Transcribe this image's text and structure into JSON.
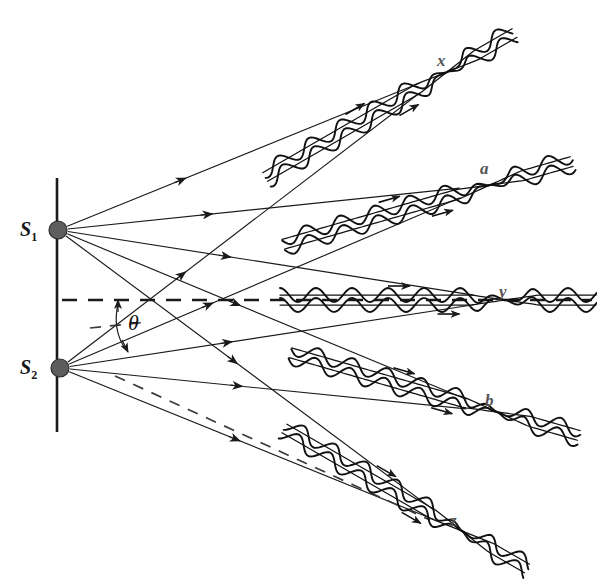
{
  "figure": {
    "background_color": "#ffffff",
    "ink_color": "#1a1a1a",
    "label_color": "#555555",
    "source_dot_color": "#5d5d5d"
  },
  "sources": [
    {
      "id": "s1",
      "label": "S",
      "subscript": "1",
      "x": 58,
      "y": 230,
      "radius": 9
    },
    {
      "id": "s2",
      "label": "S",
      "subscript": "2",
      "x": 60,
      "y": 368,
      "radius": 9
    }
  ],
  "angle": {
    "symbol": "θ",
    "x": 128,
    "y": 310,
    "description": "angle between central axis and ray direction"
  },
  "barrier": {
    "x": 57,
    "y_top": 178,
    "y_bottom": 432,
    "description": "vertical line through both sources"
  },
  "center_axis": {
    "y": 300,
    "x_start": 62,
    "x_end": 592,
    "style": "dashed",
    "description": "horizontal central axis"
  },
  "aux_line": {
    "style": "dashed",
    "description": "dashed construction ray from S2 downward-right"
  },
  "convergence_points": [
    {
      "label": "x",
      "x": 437,
      "y": 52
    },
    {
      "label": "a",
      "x": 480,
      "y": 160
    },
    {
      "label": "y",
      "x": 499,
      "y": 283
    },
    {
      "label": "b",
      "x": 485,
      "y": 392
    },
    {
      "label": "z",
      "x": 450,
      "y": 512
    }
  ],
  "wave_beams": [
    {
      "id": "beam-x",
      "label": "x",
      "converge_x": 447,
      "converge_y": 72,
      "angle_deg": -30,
      "arrow_count": 2,
      "description": "upper beam converging at x"
    },
    {
      "id": "beam-a",
      "label": "a",
      "converge_x": 490,
      "converge_y": 185,
      "angle_deg": -16,
      "arrow_count": 2,
      "description": "beam converging at a"
    },
    {
      "id": "beam-y",
      "label": "y",
      "converge_x": 505,
      "converge_y": 300,
      "angle_deg": 0,
      "arrow_count": 2,
      "description": "central beam converging at y on the axis"
    },
    {
      "id": "beam-b",
      "label": "b",
      "converge_x": 497,
      "converge_y": 412,
      "angle_deg": 16,
      "arrow_count": 2,
      "description": "beam converging at b"
    },
    {
      "id": "beam-z",
      "label": "z",
      "converge_x": 462,
      "converge_y": 531,
      "angle_deg": 30,
      "arrow_count": 2,
      "description": "lower beam converging at z"
    }
  ],
  "rays_from_s1": [
    {
      "target_x": 447,
      "target_y": 72
    },
    {
      "target_x": 490,
      "target_y": 185
    },
    {
      "target_x": 505,
      "target_y": 300
    },
    {
      "target_x": 497,
      "target_y": 412
    },
    {
      "target_x": 462,
      "target_y": 531
    }
  ],
  "rays_from_s2": [
    {
      "target_x": 447,
      "target_y": 72
    },
    {
      "target_x": 490,
      "target_y": 185
    },
    {
      "target_x": 505,
      "target_y": 300
    },
    {
      "target_x": 497,
      "target_y": 412
    },
    {
      "target_x": 462,
      "target_y": 531
    }
  ]
}
